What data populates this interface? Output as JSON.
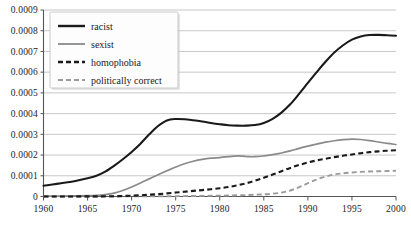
{
  "chart_data": {
    "type": "line",
    "title": "",
    "xlabel": "",
    "ylabel": "",
    "xlim": [
      1960,
      2000
    ],
    "ylim": [
      0,
      0.0009
    ],
    "grid": true,
    "legend_position": "top-left",
    "x_ticks": [
      "1960",
      "1965",
      "1970",
      "1975",
      "1980",
      "1985",
      "1990",
      "1995",
      "2000"
    ],
    "x_tick_values": [
      1960,
      1965,
      1970,
      1975,
      1980,
      1985,
      1990,
      1995,
      2000
    ],
    "y_ticks": [
      "0",
      "0.0001",
      "0.0002",
      "0.0003",
      "0.0004",
      "0.0005",
      "0.0006",
      "0.0007",
      "0.0008",
      "0.0009"
    ],
    "y_tick_values": [
      0,
      0.0001,
      0.0002,
      0.0003,
      0.0004,
      0.0005,
      0.0006,
      0.0007,
      0.0008,
      0.0009
    ],
    "x": [
      1960,
      1961,
      1962,
      1963,
      1964,
      1965,
      1966,
      1967,
      1968,
      1969,
      1970,
      1971,
      1972,
      1973,
      1974,
      1975,
      1976,
      1977,
      1978,
      1979,
      1980,
      1981,
      1982,
      1983,
      1984,
      1985,
      1986,
      1987,
      1988,
      1989,
      1990,
      1991,
      1992,
      1993,
      1994,
      1995,
      1996,
      1997,
      1998,
      1999,
      2000
    ],
    "series": [
      {
        "name": "racist",
        "color": "#1a1a1a",
        "style": "solid",
        "values": [
          5.2e-05,
          5.8e-05,
          6.4e-05,
          7e-05,
          7.8e-05,
          8.8e-05,
          0.0001,
          0.00012,
          0.000148,
          0.00018,
          0.000215,
          0.000255,
          0.0003,
          0.00034,
          0.000367,
          0.000374,
          0.000373,
          0.000368,
          0.000362,
          0.000355,
          0.000349,
          0.000344,
          0.000342,
          0.000342,
          0.000345,
          0.000355,
          0.000375,
          0.000405,
          0.000445,
          0.000495,
          0.000548,
          0.0006,
          0.00065,
          0.000695,
          0.00073,
          0.000757,
          0.000772,
          0.000779,
          0.00078,
          0.000778,
          0.000776
        ]
      },
      {
        "name": "sexist",
        "color": "#8a8a8a",
        "style": "solid",
        "values": [
          1.5e-06,
          1.8e-06,
          2.2e-06,
          2.6e-06,
          3.2e-06,
          4e-06,
          5.5e-06,
          9e-06,
          1.6e-05,
          2.9e-05,
          4.6e-05,
          6.5e-05,
          8.5e-05,
          0.000105,
          0.000124,
          0.000142,
          0.000158,
          0.00017,
          0.000179,
          0.000185,
          0.000188,
          0.000192,
          0.000196,
          0.000193,
          0.000192,
          0.000196,
          0.000202,
          0.00021,
          0.00022,
          0.000232,
          0.000243,
          0.000253,
          0.000262,
          0.000269,
          0.000274,
          0.000277,
          0.000275,
          0.00027,
          0.000263,
          0.000256,
          0.000251
        ]
      },
      {
        "name": "homophobia",
        "color": "#1a1a1a",
        "style": "dashed",
        "values": [
          2e-07,
          2e-07,
          3e-07,
          3e-07,
          4e-07,
          5e-07,
          7e-07,
          1e-06,
          1.5e-06,
          2.5e-06,
          4e-06,
          6e-06,
          8.5e-06,
          1.15e-05,
          1.5e-05,
          1.9e-05,
          2.3e-05,
          2.7e-05,
          3.1e-05,
          3.5e-05,
          4e-05,
          4.6e-05,
          5.4e-05,
          6.4e-05,
          7.6e-05,
          9e-05,
          0.000106,
          0.000122,
          0.000138,
          0.000152,
          0.000164,
          0.000174,
          0.000182,
          0.00019,
          0.000197,
          0.000203,
          0.000209,
          0.000214,
          0.000218,
          0.000221,
          0.000223
        ]
      },
      {
        "name": "politically correct",
        "color": "#9a9a9a",
        "style": "dashed",
        "values": [
          1e-07,
          1e-07,
          1e-07,
          1e-07,
          2e-07,
          2e-07,
          2e-07,
          3e-07,
          3e-07,
          4e-07,
          5e-07,
          6e-07,
          8e-07,
          1e-06,
          1.3e-06,
          1.6e-06,
          2e-06,
          2.4e-06,
          2.9e-06,
          3.4e-06,
          4e-06,
          4.8e-06,
          5.8e-06,
          7e-06,
          8.5e-06,
          1.05e-05,
          1.35e-05,
          1.9e-05,
          2.9e-05,
          4.5e-05,
          6.4e-05,
          8.2e-05,
          9.6e-05,
          0.000106,
          0.000112,
          0.000116,
          0.000119,
          0.000121,
          0.000122,
          0.000123,
          0.000124
        ]
      }
    ]
  },
  "legend": {
    "items": [
      {
        "label": "racist"
      },
      {
        "label": "sexist"
      },
      {
        "label": "homophobia"
      },
      {
        "label": "politically correct"
      }
    ]
  }
}
